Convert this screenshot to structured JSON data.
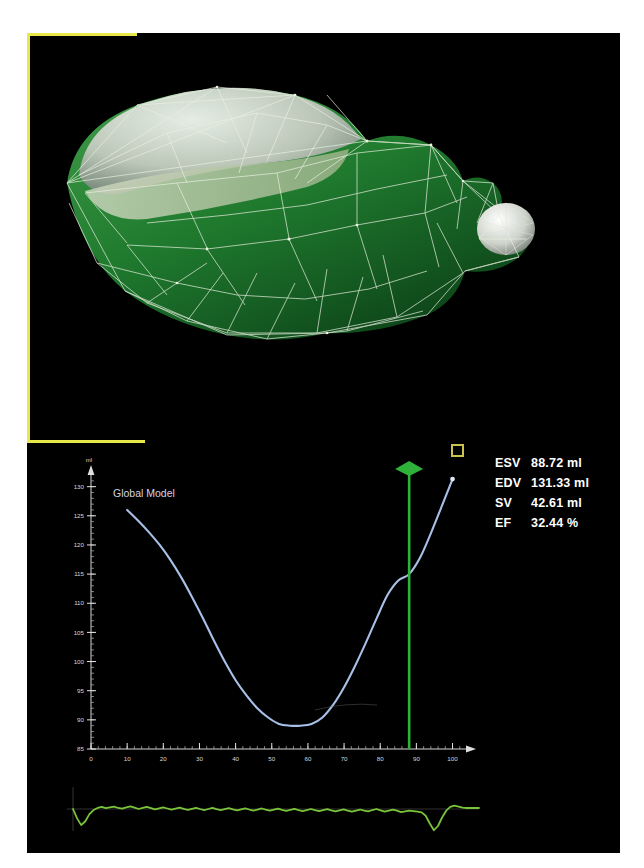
{
  "window": {
    "background": "#000000",
    "selection_frame_color": "#e8e84a"
  },
  "viewport_3d": {
    "name": "cardiac-mesh-model",
    "surface_color": "#1f7a2e",
    "wireframe_color": "#e8f0e0",
    "cap_color": "#c8ccc4",
    "background": "#000000"
  },
  "marker": {
    "square_color": "#c9c24f"
  },
  "metrics": {
    "rows": [
      {
        "label": "ESV",
        "value": "88.72 ml"
      },
      {
        "label": "EDV",
        "value": "131.33 ml"
      },
      {
        "label": "SV",
        "value": "42.61 ml"
      },
      {
        "label": "EF",
        "value": "32.44 %"
      }
    ]
  },
  "chart_data": {
    "type": "line",
    "title": "",
    "series_label": "Global Model",
    "xlabel": "%",
    "ylabel": "ml",
    "xlim": [
      0,
      104
    ],
    "ylim": [
      85,
      132
    ],
    "xticks": [
      0,
      10,
      20,
      30,
      40,
      50,
      60,
      70,
      80,
      90,
      100
    ],
    "yticks": [
      85,
      90,
      95,
      100,
      105,
      110,
      115,
      120,
      125,
      130
    ],
    "minor_tick_step_x": 2,
    "minor_tick_step_y": 1,
    "grid": false,
    "legend": "none",
    "line_color": "#a8c0e8",
    "cursor": {
      "x": 88,
      "color": "#2fb23a",
      "handle": "diamond",
      "label": "phase-cursor"
    },
    "x": [
      10,
      13,
      16,
      19,
      22,
      25,
      28,
      31,
      34,
      37,
      40,
      43,
      46,
      49,
      52,
      55,
      58,
      61,
      64,
      67,
      70,
      73,
      76,
      79,
      82,
      85,
      88,
      91,
      94,
      97,
      100
    ],
    "values": [
      126.0,
      124.2,
      122.2,
      120.0,
      117.4,
      114.4,
      111.0,
      107.4,
      103.6,
      100.0,
      96.8,
      94.2,
      92.0,
      90.4,
      89.3,
      89.0,
      89.0,
      89.3,
      90.4,
      92.6,
      95.6,
      99.2,
      103.2,
      107.4,
      111.4,
      113.9,
      115.0,
      117.8,
      122.0,
      126.6,
      131.3
    ]
  },
  "ecg": {
    "name": "ecg-waveform",
    "trace_color": "#7ac43a",
    "axis_color": "#8a8a8a",
    "samples": [
      0.0,
      -0.55,
      -0.95,
      -0.72,
      -0.3,
      -0.06,
      0.06,
      0.12,
      0.05,
      0.1,
      0.14,
      0.06,
      0.02,
      0.1,
      0.16,
      0.08,
      0.0,
      0.06,
      0.12,
      0.05,
      -0.02,
      0.04,
      0.1,
      0.03,
      -0.04,
      0.02,
      0.08,
      0.01,
      -0.05,
      0.01,
      0.07,
      0.0,
      -0.06,
      0.0,
      0.06,
      -0.01,
      -0.07,
      -0.01,
      0.05,
      -0.02,
      -0.08,
      -0.02,
      0.04,
      -0.03,
      -0.09,
      -0.03,
      0.03,
      -0.04,
      -0.1,
      -0.04,
      0.02,
      -0.05,
      -0.11,
      -0.05,
      0.01,
      -0.06,
      -0.12,
      -0.06,
      0.0,
      -0.07,
      -0.13,
      -0.07,
      -0.01,
      -0.08,
      -0.14,
      -0.08,
      -0.02,
      -0.09,
      -0.15,
      -0.09,
      -0.03,
      -0.1,
      -0.14,
      -0.06,
      0.0,
      -0.08,
      -0.16,
      -0.1,
      -0.04,
      -0.1,
      -0.18,
      -0.14,
      -0.1,
      -0.12,
      -0.16,
      -0.2,
      -0.4,
      -0.85,
      -1.25,
      -1.0,
      -0.5,
      -0.1,
      0.12,
      0.2,
      0.14,
      0.08,
      0.06,
      0.06,
      0.06,
      0.06
    ]
  }
}
